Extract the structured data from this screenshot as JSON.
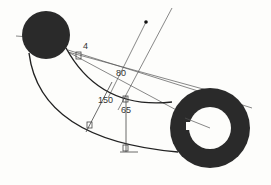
{
  "diagram": {
    "colors": {
      "background": "#fdfdfb",
      "shape_fill": "#2a2a2a",
      "line": "#333333",
      "construction_line": "#555555"
    },
    "shapes": {
      "solid_circle": {
        "cx": 46,
        "cy": 35,
        "r": 24
      },
      "ring": {
        "cx": 210,
        "cy": 128,
        "outer_r": 40,
        "inner_r": 21
      }
    },
    "dimensions": [
      {
        "id": "dim-4",
        "label": "4",
        "x": 83,
        "y": 49
      },
      {
        "id": "dim-80",
        "label": "80",
        "x": 116,
        "y": 76
      },
      {
        "id": "dim-150",
        "label": "150",
        "x": 98,
        "y": 103
      },
      {
        "id": "dim-65",
        "label": "65",
        "x": 121,
        "y": 113
      }
    ],
    "points": [
      {
        "id": "center-dot",
        "x": 146,
        "y": 22
      }
    ]
  }
}
